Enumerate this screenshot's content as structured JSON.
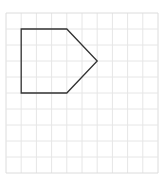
{
  "figure": {
    "grid": {
      "x0": 6,
      "y0": 13,
      "cols": 10,
      "rows": 10,
      "cell_w": 15.2,
      "cell_h": 16,
      "line_color": "#e6e6e6",
      "border_color": "#dcdcdc"
    },
    "shape": {
      "name": "pentagon",
      "stroke": "#333333",
      "stroke_width": 1.3,
      "vertices_grid": [
        [
          1,
          1
        ],
        [
          4,
          1
        ],
        [
          6,
          3
        ],
        [
          4,
          5
        ],
        [
          1,
          5
        ]
      ]
    }
  }
}
